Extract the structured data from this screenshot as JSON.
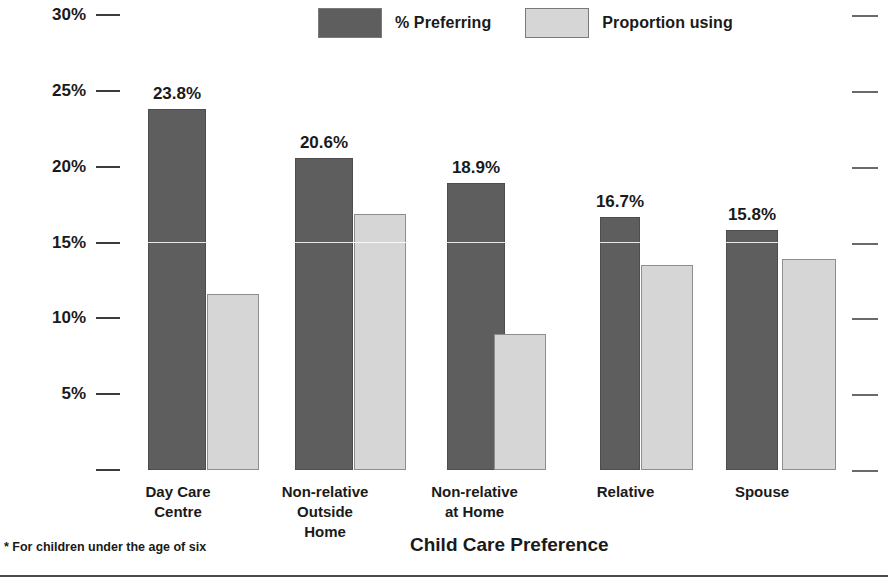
{
  "chart_data": {
    "type": "bar",
    "title": "",
    "xlabel": "Child Care Preference",
    "ylabel": "",
    "categories": [
      "Day Care Centre",
      "Non-relative Outside Home",
      "Non-relative at Home",
      "Relative",
      "Spouse"
    ],
    "category_lines": [
      [
        "Day Care Centre"
      ],
      [
        "Non-relative",
        "Outside Home"
      ],
      [
        "Non-relative",
        "at Home"
      ],
      [
        "Relative"
      ],
      [
        "Spouse"
      ]
    ],
    "series": [
      {
        "name": "% Preferring",
        "color": "#5e5e5e",
        "values": [
          23.8,
          20.6,
          18.9,
          16.7,
          15.8
        ],
        "labels": [
          "23.8%",
          "20.6%",
          "18.9%",
          "16.7%",
          "15.8%"
        ]
      },
      {
        "name": "Proportion using",
        "color": "#d6d6d6",
        "values": [
          11.6,
          16.9,
          9.0,
          13.5,
          13.9
        ],
        "labels": [
          "",
          "",
          "",
          "",
          ""
        ]
      }
    ],
    "ylim": [
      0,
      30
    ],
    "yticks": [
      0,
      5,
      10,
      15,
      20,
      25,
      30
    ],
    "ytick_labels": [
      "",
      "5%",
      "10%",
      "15%",
      "20%",
      "25%",
      "30%"
    ],
    "grid": false,
    "legend_position": "top-center",
    "footnote": "* For children under the age of six"
  },
  "legend": {
    "items": [
      {
        "label": "% Preferring",
        "swatch": "dark-swatch"
      },
      {
        "label": "Proportion using",
        "swatch": "light-swatch"
      }
    ]
  },
  "footer": {
    "footnote": "* For children under the age of six",
    "axis_title": "Child Care Preference"
  }
}
